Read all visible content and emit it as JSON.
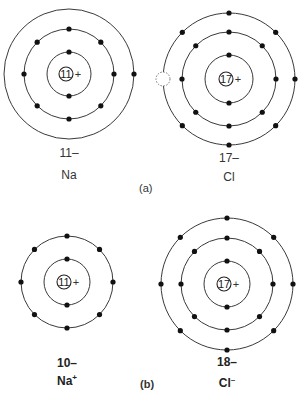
{
  "figure": {
    "part_a_label": "(a)",
    "part_b_label": "(b)",
    "atoms": [
      {
        "id": "na-atom",
        "symbol": "Na",
        "electron_count_label": "11–",
        "nucleus_charge": "11",
        "nucleus_sign": "+",
        "center": [
          69,
          74
        ],
        "shells": [
          {
            "radius": 22,
            "electrons": 2
          },
          {
            "radius": 45,
            "electrons": 8
          },
          {
            "radius": 65,
            "electrons": 1
          }
        ]
      },
      {
        "id": "cl-atom",
        "symbol": "Cl",
        "electron_count_label": "17–",
        "nucleus_charge": "17",
        "nucleus_sign": "+",
        "center": [
          229,
          79
        ],
        "shells": [
          {
            "radius": 24,
            "electrons": 2
          },
          {
            "radius": 47,
            "electrons": 8
          },
          {
            "radius": 66,
            "electrons": 7,
            "vacancy": "left"
          }
        ]
      },
      {
        "id": "na-ion",
        "symbol": "Na",
        "symbol_superscript": "+",
        "electron_count_label": "10–",
        "nucleus_charge": "11",
        "nucleus_sign": "+",
        "center": [
          67,
          282
        ],
        "shells": [
          {
            "radius": 23,
            "electrons": 2
          },
          {
            "radius": 46,
            "electrons": 8
          }
        ]
      },
      {
        "id": "cl-ion",
        "symbol": "Cl",
        "symbol_superscript": "–",
        "electron_count_label": "18–",
        "nucleus_charge": "17",
        "nucleus_sign": "+",
        "center": [
          227,
          284
        ],
        "shells": [
          {
            "radius": 23,
            "electrons": 2
          },
          {
            "radius": 46,
            "electrons": 8
          },
          {
            "radius": 66,
            "electrons": 8
          }
        ]
      }
    ]
  }
}
